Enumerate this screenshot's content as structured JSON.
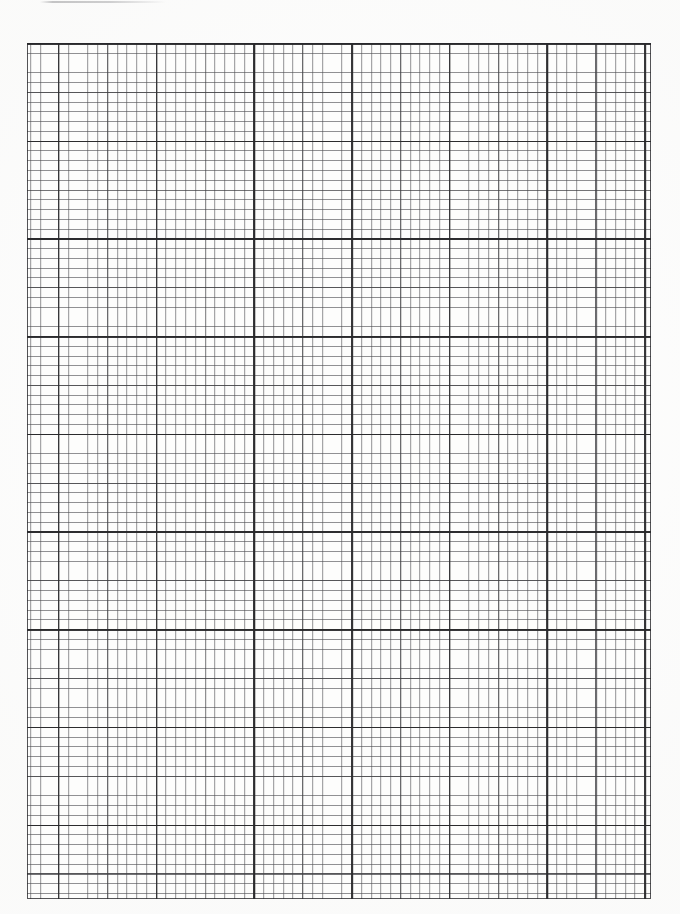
{
  "document": {
    "kind": "graph-paper-scan",
    "title": "Scanned engineering graph paper sheet",
    "page_background": "#ffffff",
    "caption": ""
  },
  "chart_data": {
    "type": "grid",
    "title": "",
    "subtitle": "",
    "xlabel": "",
    "ylabel": "",
    "grid": "on",
    "legend": "none",
    "annotations": [],
    "tick_labels": {
      "x": [],
      "y": []
    },
    "geometry": {
      "page_width_px": 680,
      "page_height_px": 914,
      "grid_left_px": 27,
      "grid_top_px": 43,
      "grid_width_px": 624,
      "grid_height_px": 856,
      "minor_cell_px": 9.77,
      "medium_every_n_cells": 5,
      "major_every_n_cells": 10,
      "minor_columns": 64,
      "minor_rows": 88,
      "major_columns": 7,
      "major_rows": 9,
      "vertical_major_offset_px": 31.2,
      "horizontal_major_offset_px": 0
    },
    "colors": {
      "minor_line": "#46464a",
      "medium_line": "#343438",
      "major_line": "#1c1c1e",
      "border_line": "#28282c",
      "paper": "#fdfdfc",
      "page": "#ffffff",
      "artifact": "#78787c"
    },
    "major_vertical_positions_px": [
      58,
      156,
      253,
      351,
      449,
      547,
      645
    ],
    "major_horizontal_positions_px": [
      44,
      142,
      239,
      337,
      435,
      532,
      630,
      728,
      825
    ],
    "values": [],
    "categories": []
  },
  "artifacts": {
    "top_streak": {
      "name": "scanner-streak",
      "left_px": 40,
      "top_px": 1,
      "width_px": 126,
      "height_px": 2
    }
  },
  "margins": {
    "top_label": "",
    "bottom_label": "",
    "left_label": "",
    "right_label": ""
  }
}
